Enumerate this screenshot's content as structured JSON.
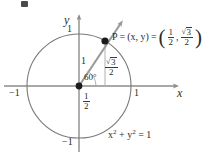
{
  "figure": {
    "kind": "unit-circle-diagram",
    "width": 205,
    "height": 157,
    "background_color": "#ffffff"
  },
  "axes": {
    "x_name": "x",
    "y_name": "y",
    "x_ticks": [
      {
        "label": "−1",
        "value": -1
      },
      {
        "label": "1",
        "value": 1
      }
    ],
    "y_ticks": [
      {
        "label": "1",
        "value": 1
      },
      {
        "label": "−1",
        "value": -1
      }
    ],
    "axis_color": "#8c8c8c"
  },
  "curve": {
    "name": "unit-circle",
    "equation_x": "x",
    "equation_exp_2a": "2",
    "equation_plus": "+",
    "equation_y": "y",
    "equation_exp_2b": "2",
    "equation_eq": "= 1",
    "stroke_color": "#7a7a7a",
    "radius_value": 1
  },
  "point": {
    "name": "P",
    "label_p": "P",
    "eq1": "=",
    "generic": "(x, y)",
    "eq2": "=",
    "coord_x_num": "1",
    "coord_x_den": "2",
    "coord_comma": ",",
    "coord_y_radical": "√",
    "coord_y_radicand": "3",
    "coord_y_den": "2",
    "dot_color": "#1b1b1b"
  },
  "annotations": {
    "radius_label": "1",
    "angle_label": "60°",
    "sin_num_radical": "√",
    "sin_num_radicand": "3",
    "sin_den": "2",
    "cos_num": "1",
    "cos_den": "2",
    "ray_color": "#9a9a9a",
    "drop_line_color": "#b0b0b0"
  }
}
